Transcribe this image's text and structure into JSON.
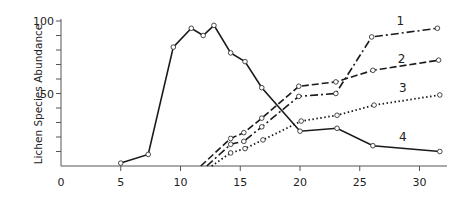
{
  "chart_data": {
    "type": "line",
    "title": "",
    "xlabel": "",
    "ylabel": "Lichen Species Abundance",
    "xlim": [
      0,
      32
    ],
    "ylim": [
      0,
      100
    ],
    "x_ticks": [
      0,
      5,
      10,
      15,
      20,
      25,
      30
    ],
    "x_tick_labels": [
      "0",
      "5",
      "10",
      "15",
      "20",
      "25",
      "30"
    ],
    "y_ticks_minor": [
      10,
      20,
      30,
      40,
      50,
      60,
      70,
      80,
      90,
      100
    ],
    "y_tick_labels": [
      {
        "value": 50,
        "label": "50"
      },
      {
        "value": 100,
        "label": "100"
      }
    ],
    "grid": false,
    "legend": "inline labels at right end of each line",
    "series": [
      {
        "name": "1",
        "style": "dash-dot",
        "label_pos": [
          28.4,
          97
        ],
        "points": [
          [
            12.2,
            0
          ],
          [
            14.2,
            15
          ],
          [
            15.3,
            17
          ],
          [
            16.8,
            27
          ],
          [
            19.9,
            48
          ],
          [
            23.0,
            50
          ],
          [
            26.0,
            89
          ],
          [
            31.5,
            95
          ]
        ]
      },
      {
        "name": "2",
        "style": "dashed",
        "label_pos": [
          28.5,
          71
        ],
        "points": [
          [
            11.7,
            0
          ],
          [
            14.2,
            19
          ],
          [
            15.3,
            23
          ],
          [
            16.8,
            33
          ],
          [
            19.9,
            55
          ],
          [
            23.0,
            58
          ],
          [
            26.1,
            66
          ],
          [
            31.6,
            73
          ]
        ]
      },
      {
        "name": "3",
        "style": "dotted",
        "label_pos": [
          28.6,
          51
        ],
        "points": [
          [
            12.6,
            0
          ],
          [
            14.2,
            9
          ],
          [
            15.4,
            12
          ],
          [
            16.9,
            18
          ],
          [
            20.1,
            31
          ],
          [
            23.1,
            35
          ],
          [
            26.2,
            42
          ],
          [
            31.7,
            49
          ]
        ]
      },
      {
        "name": "4",
        "style": "solid",
        "label_pos": [
          28.6,
          17
        ],
        "points": [
          [
            5.0,
            2
          ],
          [
            7.3,
            8
          ],
          [
            9.4,
            82
          ],
          [
            10.9,
            95
          ],
          [
            11.9,
            90
          ],
          [
            12.8,
            97
          ],
          [
            14.2,
            78
          ],
          [
            15.4,
            72
          ],
          [
            16.8,
            54
          ],
          [
            20.0,
            24
          ],
          [
            23.1,
            26
          ],
          [
            26.1,
            14
          ],
          [
            31.7,
            10
          ]
        ]
      }
    ]
  }
}
